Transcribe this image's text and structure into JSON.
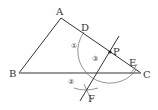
{
  "figure": {
    "type": "geometry-construction",
    "points": {
      "A": {
        "label": "A",
        "x": 61,
        "y": 18
      },
      "B": {
        "label": "B",
        "x": 19,
        "y": 73
      },
      "C": {
        "label": "C",
        "x": 141,
        "y": 73
      },
      "D": {
        "label": "D",
        "x": 85,
        "y": 34
      },
      "E": {
        "label": "E",
        "x": 133,
        "y": 67
      },
      "P": {
        "label": "P",
        "x": 110,
        "y": 52
      },
      "F": {
        "label": "F",
        "x": 86,
        "y": 92
      }
    },
    "step_labels": {
      "one": "①",
      "two": "②",
      "three": "③"
    },
    "colors": {
      "stroke": "#333333",
      "baseline": "#777777",
      "arc": "#666666"
    }
  }
}
